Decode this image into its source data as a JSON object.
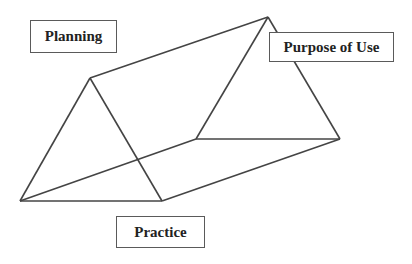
{
  "diagram": {
    "type": "triangular-prism",
    "labels": {
      "planning": "Planning",
      "purpose_of_use": "Purpose of Use",
      "practice": "Practice"
    },
    "colors": {
      "line": "#444444",
      "box_border": "#5a5a5a",
      "text": "#222222",
      "background": "#ffffff"
    }
  }
}
